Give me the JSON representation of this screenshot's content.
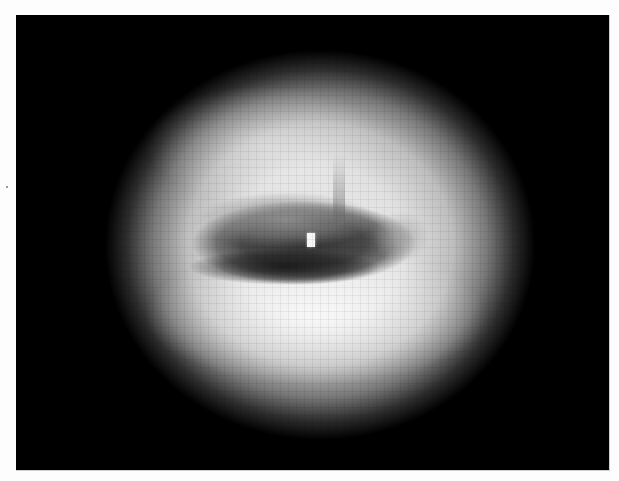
{
  "image": {
    "description": "Grayscale pixelated image of a bright diffuse elliptical halo with a dark elliptical inner cavity and a single bright pixel near its center",
    "colors": {
      "background": "#000000",
      "halo_peak": "#f0f0f0",
      "cavity": "#2a2a2a",
      "bright_pixel": "#f6f6f6",
      "page": "#fdfdfd",
      "frame_border": "#cfcfcf"
    },
    "features": [
      {
        "name": "outer-halo",
        "shape": "ellipse"
      },
      {
        "name": "inner-cavity",
        "shape": "ellipse"
      },
      {
        "name": "bright-pixel",
        "shape": "point"
      }
    ]
  }
}
